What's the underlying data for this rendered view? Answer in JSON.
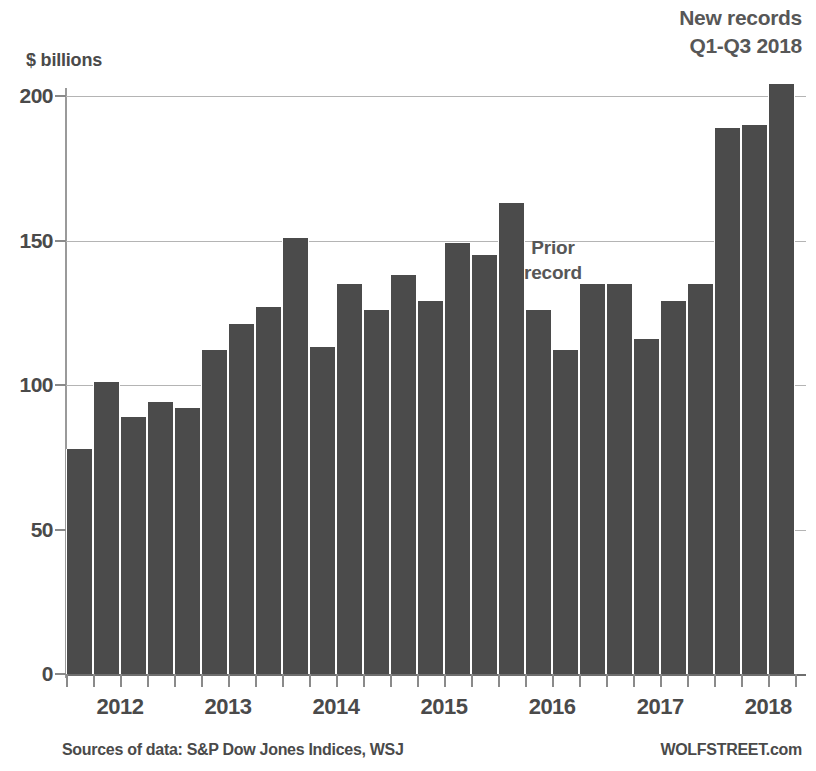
{
  "header": {
    "title": "",
    "new_records_line1": "New records",
    "new_records_line2": "Q1-Q3 2018"
  },
  "annotations": {
    "prior_record_line1": "Prior",
    "prior_record_line2": "record"
  },
  "footer": {
    "sources": "Sources of data: S&P Dow Jones Indices, WSJ",
    "brand": "WOLFSTREET.com"
  },
  "colors": {
    "bar": "#4b4b4b",
    "gridline": "#b4b4b4",
    "axis": "#8a8a8a",
    "text": "#4a4a4a",
    "annotation": "#575757",
    "background": "#ffffff"
  },
  "chart_data": {
    "type": "bar",
    "title": "",
    "xlabel": "",
    "ylabel": "$ billions",
    "ylim": [
      0,
      200
    ],
    "yticks": [
      0,
      50,
      100,
      150,
      200
    ],
    "ytick_labels": [
      "0",
      "50",
      "100",
      "150",
      "200"
    ],
    "grid": true,
    "legend": "none",
    "xtick_labels": [
      "2012",
      "2013",
      "2014",
      "2015",
      "2016",
      "2017",
      "2018"
    ],
    "categories": [
      "2012 Q1",
      "2012 Q2",
      "2012 Q3",
      "2012 Q4",
      "2013 Q1",
      "2013 Q2",
      "2013 Q3",
      "2013 Q4",
      "2014 Q1",
      "2014 Q2",
      "2014 Q3",
      "2014 Q4",
      "2015 Q1",
      "2015 Q2",
      "2015 Q3",
      "2015 Q4",
      "2016 Q1",
      "2016 Q2",
      "2016 Q3",
      "2016 Q4",
      "2017 Q1",
      "2017 Q2",
      "2017 Q3",
      "2017 Q4",
      "2018 Q1",
      "2018 Q2",
      "2018 Q3"
    ],
    "values": [
      78,
      101,
      89,
      94,
      92,
      112,
      121,
      127,
      151,
      113,
      135,
      126,
      138,
      129,
      149,
      145,
      163,
      126,
      112,
      135,
      135,
      116,
      129,
      135,
      189,
      190,
      204
    ],
    "annotations": [
      {
        "text": "Prior record",
        "category": "2016 Q1",
        "value": 163
      },
      {
        "text": "New records Q1-Q3 2018",
        "category": "2018 Q3",
        "value": 204
      }
    ]
  }
}
